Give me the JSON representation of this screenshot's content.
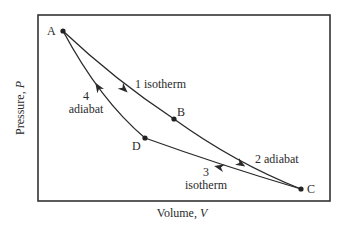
{
  "diagram": {
    "type": "Carnot cycle P-V diagram",
    "axes": {
      "xlabel": "Volume, ",
      "xlabel_var": "V",
      "ylabel": "Pressure, ",
      "ylabel_var": "P"
    },
    "points": [
      {
        "id": "A",
        "label": "A"
      },
      {
        "id": "B",
        "label": "B"
      },
      {
        "id": "C",
        "label": "C"
      },
      {
        "id": "D",
        "label": "D"
      }
    ],
    "processes": [
      {
        "step": "1",
        "name": "isotherm",
        "from": "A",
        "to": "B",
        "label": "1 isotherm"
      },
      {
        "step": "2",
        "name": "adiabat",
        "from": "B",
        "to": "C",
        "label": "2 adiabat"
      },
      {
        "step": "3",
        "name": "isotherm",
        "from": "C",
        "to": "D",
        "num": "3",
        "word": "isotherm"
      },
      {
        "step": "4",
        "name": "adiabat",
        "from": "D",
        "to": "A",
        "num": "4",
        "word": "adiabat"
      }
    ],
    "colors": {
      "line": "#2a2a2a",
      "frame": "#333333",
      "background": "#ffffff"
    }
  }
}
